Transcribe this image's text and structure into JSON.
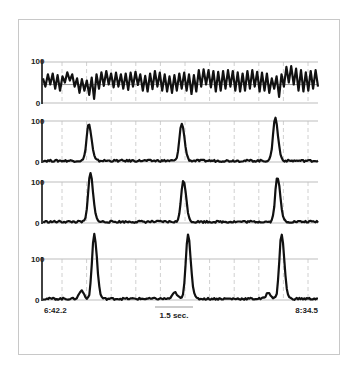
{
  "chart_data": {
    "type": "line",
    "title": "",
    "layout": {
      "panels": 4,
      "stacked_vertically": true,
      "grid": "dashed vertical gridlines, solid horizontal line at 100",
      "legend": "none"
    },
    "x_axis": {
      "start_label": "6:42.2",
      "end_label": "8:34.5",
      "scale_bar_label": "1.5 sec.",
      "gridline_count": 11
    },
    "panels": [
      {
        "name": "oscillating-trace",
        "y_ticks": [
          "100",
          "0"
        ],
        "ylim": [
          0,
          100
        ],
        "reference_line": 45,
        "description": "continuous oscillating signal, ~25 cycles across window, range ~20-85",
        "values": [
          60,
          40,
          70,
          45,
          72,
          35,
          68,
          30,
          65,
          50,
          75,
          55,
          70,
          40,
          60,
          25,
          58,
          30,
          55,
          20,
          62,
          10,
          70,
          35,
          75,
          42,
          78,
          45,
          72,
          38,
          74,
          40,
          70,
          35,
          72,
          32,
          74,
          40,
          76,
          44,
          70,
          30,
          66,
          28,
          72,
          34,
          78,
          40,
          74,
          30,
          70,
          28,
          65,
          25,
          68,
          30,
          72,
          35,
          74,
          30,
          70,
          22,
          68,
          28,
          80,
          40,
          82,
          45,
          80,
          38,
          78,
          28,
          76,
          30,
          78,
          35,
          80,
          40,
          78,
          30,
          75,
          28,
          72,
          30,
          78,
          35,
          80,
          40,
          76,
          28,
          74,
          30,
          72,
          25,
          60,
          35,
          65,
          15,
          70,
          40,
          88,
          50,
          90,
          45,
          84,
          30,
          80,
          28,
          75,
          30,
          78,
          35,
          80,
          40
        ]
      },
      {
        "name": "peak-trace-1",
        "y_ticks": [
          "100",
          "0"
        ],
        "ylim": [
          0,
          100
        ],
        "peaks": [
          {
            "x_frac": 0.166,
            "value": 90
          },
          {
            "x_frac": 0.504,
            "value": 92
          },
          {
            "x_frac": 0.844,
            "value": 105
          }
        ],
        "baseline": 3
      },
      {
        "name": "peak-trace-2",
        "y_ticks": [
          "100",
          "0"
        ],
        "ylim": [
          0,
          100
        ],
        "peaks": [
          {
            "x_frac": 0.172,
            "value": 118
          },
          {
            "x_frac": 0.51,
            "value": 102
          },
          {
            "x_frac": 0.852,
            "value": 110
          }
        ],
        "baseline": 3
      },
      {
        "name": "peak-trace-3",
        "y_ticks": [
          "100",
          "0"
        ],
        "ylim": [
          0,
          100
        ],
        "peaks": [
          {
            "x_frac": 0.186,
            "value": 158
          },
          {
            "x_frac": 0.527,
            "value": 158
          },
          {
            "x_frac": 0.867,
            "value": 158
          }
        ],
        "pre_bumps": [
          {
            "x_frac": 0.14,
            "value": 20
          },
          {
            "x_frac": 0.48,
            "value": 15
          },
          {
            "x_frac": 0.82,
            "value": 15
          }
        ],
        "baseline": 3
      }
    ]
  },
  "labels": {
    "start_time": "6:42.2",
    "end_time": "8:34.5",
    "scale_bar": "1.5 sec.",
    "tick_100": "100",
    "tick_0": "0"
  }
}
